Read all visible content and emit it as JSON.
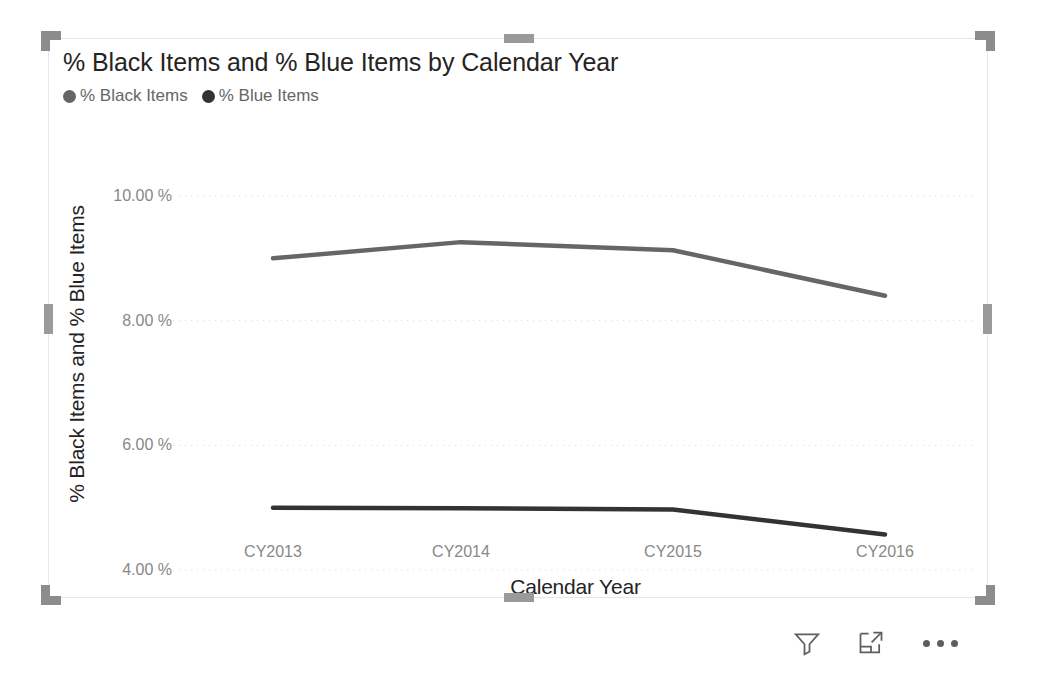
{
  "visual": {
    "title": "% Black Items and % Blue Items by Calendar Year",
    "selected": true
  },
  "legend": {
    "items": [
      {
        "label": "% Black Items",
        "color": "#666666"
      },
      {
        "label": "% Blue Items",
        "color": "#333333"
      }
    ]
  },
  "footer": {
    "filter_label": "Filters",
    "focus_label": "Focus mode",
    "more_label": "More options"
  },
  "chart_data": {
    "type": "line",
    "title": "% Black Items and % Blue Items by Calendar Year",
    "xlabel": "Calendar Year",
    "ylabel": "% Black Items and % Blue Items",
    "categories": [
      "CY2013",
      "CY2014",
      "CY2015",
      "CY2016"
    ],
    "series": [
      {
        "name": "% Black Items",
        "color": "#666666",
        "values": [
          9.0,
          9.26,
          9.13,
          8.4
        ]
      },
      {
        "name": "% Blue Items",
        "color": "#333333",
        "values": [
          5.0,
          4.99,
          4.97,
          4.57
        ]
      }
    ],
    "ylim": [
      3.2,
      10.55
    ],
    "yticks": [
      10,
      8,
      6,
      4
    ],
    "ytick_labels": [
      "10.00 %",
      "8.00 %",
      "6.00 %",
      "4.00 %"
    ],
    "grid": true,
    "grid_style": "dotted",
    "legend_position": "top-left"
  }
}
